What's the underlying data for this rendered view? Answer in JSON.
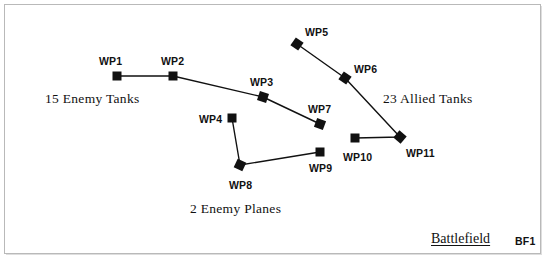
{
  "canvas": {
    "width": 547,
    "height": 267,
    "background": "#ffffff",
    "border_color": "#b9b9b9"
  },
  "title": {
    "name": "Battlefield",
    "code": "BF1"
  },
  "chart_data": {
    "type": "scatter",
    "title": "Battlefield",
    "xlabel": "",
    "ylabel": "",
    "xlim": [
      0,
      547
    ],
    "ylim": [
      0,
      267
    ],
    "grid": false,
    "legend": "none",
    "marker_color": "#111111",
    "line_color": "#111111",
    "series": [
      {
        "name": "15 Enemy Tanks",
        "annotation": "15 Enemy Tanks",
        "annotation_x": 45,
        "annotation_y": 92,
        "points": [
          {
            "label": "WP1",
            "x": 117,
            "y": 76,
            "marker": "square",
            "rotation": 0,
            "label_x": 99,
            "label_y": 56
          },
          {
            "label": "WP2",
            "x": 173,
            "y": 76,
            "marker": "square",
            "rotation": 0,
            "label_x": 161,
            "label_y": 56
          },
          {
            "label": "WP3",
            "x": 263,
            "y": 97,
            "marker": "diamond",
            "rotation": 18,
            "label_x": 250,
            "label_y": 77
          },
          {
            "label": "WP7",
            "x": 320,
            "y": 124,
            "marker": "diamond",
            "rotation": 20,
            "label_x": 308,
            "label_y": 104
          }
        ]
      },
      {
        "name": "2 Enemy Planes",
        "annotation": "2 Enemy Planes",
        "annotation_x": 190,
        "annotation_y": 202,
        "points": [
          {
            "label": "WP4",
            "x": 232,
            "y": 118,
            "marker": "square",
            "rotation": 0,
            "label_x": 199,
            "label_y": 114
          },
          {
            "label": "WP8",
            "x": 240,
            "y": 165,
            "marker": "diamond",
            "rotation": 25,
            "label_x": 229,
            "label_y": 180
          },
          {
            "label": "WP9",
            "x": 320,
            "y": 152,
            "marker": "square",
            "rotation": 0,
            "label_x": 309,
            "label_y": 163
          }
        ]
      },
      {
        "name": "23 Allied Tanks",
        "annotation": "23 Allied Tanks",
        "annotation_x": 383,
        "annotation_y": 92,
        "points": [
          {
            "label": "WP5",
            "x": 297,
            "y": 44,
            "marker": "diamond",
            "rotation": 35,
            "label_x": 305,
            "label_y": 27
          },
          {
            "label": "WP6",
            "x": 345,
            "y": 78,
            "marker": "diamond",
            "rotation": 35,
            "label_x": 354,
            "label_y": 64
          },
          {
            "label": "WP11",
            "x": 400,
            "y": 137,
            "marker": "diamond",
            "rotation": 40,
            "label_x": 406,
            "label_y": 148
          },
          {
            "label": "WP10",
            "x": 355,
            "y": 138,
            "marker": "square",
            "rotation": 0,
            "label_x": 343,
            "label_y": 152
          }
        ]
      }
    ]
  }
}
